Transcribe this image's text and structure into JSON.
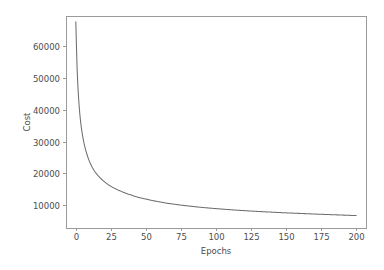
{
  "figure": {
    "background_color": "#ffffff",
    "plot_area": {
      "left": 66,
      "top": 16,
      "right": 366,
      "bottom": 228
    },
    "axis_color": "#9a9a9a",
    "text_color": "#4d4d4d"
  },
  "chart_data": {
    "type": "line",
    "title": "",
    "xlabel": "Epochs",
    "ylabel": "Cost",
    "xlim": [
      -7,
      207
    ],
    "ylim": [
      2800,
      69500
    ],
    "grid": false,
    "legend": null,
    "line_color": "#6e6e6e",
    "xticks": [
      0,
      25,
      50,
      75,
      100,
      125,
      150,
      175,
      200
    ],
    "xtick_labels": [
      "0",
      "25",
      "50",
      "75",
      "100",
      "125",
      "150",
      "175",
      "200"
    ],
    "yticks": [
      10000,
      20000,
      30000,
      40000,
      50000,
      60000
    ],
    "ytick_labels": [
      "10000",
      "20000",
      "30000",
      "40000",
      "50000",
      "60000"
    ],
    "series": [
      {
        "name": "cost",
        "x": [
          0,
          1,
          2,
          3,
          4,
          5,
          6,
          7,
          8,
          9,
          10,
          12,
          14,
          16,
          18,
          20,
          24,
          28,
          32,
          36,
          40,
          45,
          50,
          55,
          60,
          65,
          70,
          75,
          80,
          85,
          90,
          95,
          100,
          110,
          120,
          130,
          140,
          150,
          160,
          170,
          180,
          190,
          200
        ],
        "y": [
          67700,
          52000,
          43500,
          38000,
          34200,
          31400,
          29200,
          27400,
          25900,
          24600,
          23500,
          21700,
          20300,
          19200,
          18300,
          17500,
          16200,
          15200,
          14400,
          13700,
          13100,
          12400,
          11900,
          11400,
          11000,
          10600,
          10300,
          10000,
          9750,
          9500,
          9280,
          9080,
          8900,
          8560,
          8270,
          8010,
          7780,
          7570,
          7380,
          7200,
          7030,
          6870,
          6700
        ]
      }
    ]
  }
}
